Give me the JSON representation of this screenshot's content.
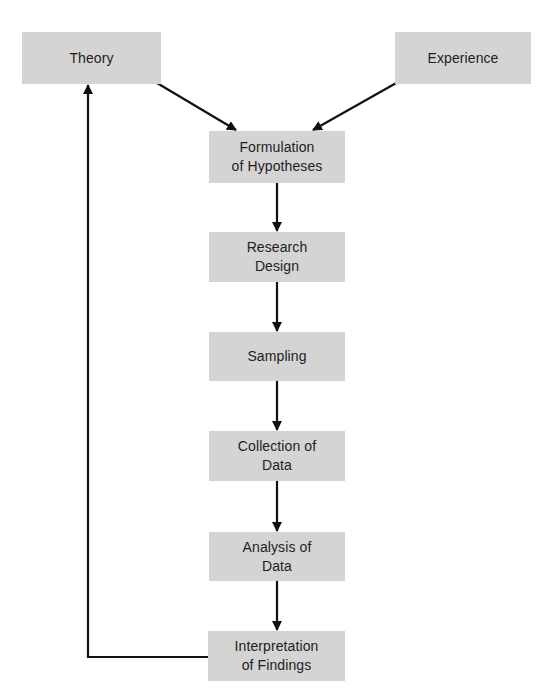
{
  "diagram": {
    "type": "flowchart",
    "colors": {
      "background": "#ffffff",
      "node_fill": "#d4d4d4",
      "text": "#1e1e1e",
      "edge": "#111111"
    },
    "nodes": {
      "theory": {
        "label": "Theory"
      },
      "experience": {
        "label": "Experience"
      },
      "formulation": {
        "label": "Formulation\nof Hypotheses"
      },
      "research_design": {
        "label": "Research\nDesign"
      },
      "sampling": {
        "label": "Sampling"
      },
      "collection": {
        "label": "Collection of\nData"
      },
      "analysis": {
        "label": "Analysis of\nData"
      },
      "interpretation": {
        "label": "Interpretation\nof Findings"
      }
    },
    "edges": [
      {
        "from": "Theory",
        "to": "Formulation of Hypotheses"
      },
      {
        "from": "Experience",
        "to": "Formulation of Hypotheses"
      },
      {
        "from": "Formulation of Hypotheses",
        "to": "Research Design"
      },
      {
        "from": "Research Design",
        "to": "Sampling"
      },
      {
        "from": "Sampling",
        "to": "Collection of Data"
      },
      {
        "from": "Collection of Data",
        "to": "Analysis of Data"
      },
      {
        "from": "Analysis of Data",
        "to": "Interpretation of Findings"
      },
      {
        "from": "Interpretation of Findings",
        "to": "Theory",
        "style": "feedback-loop"
      }
    ]
  }
}
